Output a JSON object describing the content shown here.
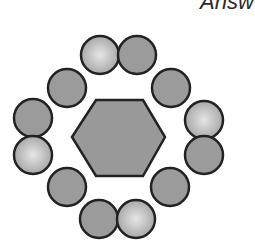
{
  "header": {
    "label": "Answ"
  },
  "colors": {
    "background": "#ffffff",
    "stroke": "#222222",
    "dark_fill": "#9b9b9b",
    "light_center": "#e6e6e6",
    "light_edge": "#a2a2a2",
    "hexagon_fill": "#999999"
  },
  "diagram": {
    "hexagon": {
      "points": "72,137 96,100 143,100 165,137 143,176 96,176"
    },
    "circle_radius": 19,
    "circles": [
      {
        "position": "top-left",
        "cx": 100,
        "cy": 55,
        "shade": "light"
      },
      {
        "position": "top-right",
        "cx": 137,
        "cy": 55,
        "shade": "dark"
      },
      {
        "position": "upper-left",
        "cx": 67,
        "cy": 88,
        "shade": "dark"
      },
      {
        "position": "upper-right",
        "cx": 171,
        "cy": 88,
        "shade": "dark"
      },
      {
        "position": "left-upper",
        "cx": 33,
        "cy": 118,
        "shade": "dark"
      },
      {
        "position": "left-lower",
        "cx": 33,
        "cy": 155,
        "shade": "light"
      },
      {
        "position": "right-upper",
        "cx": 204,
        "cy": 120,
        "shade": "light"
      },
      {
        "position": "right-lower",
        "cx": 204,
        "cy": 155,
        "shade": "dark"
      },
      {
        "position": "lower-left",
        "cx": 67,
        "cy": 187,
        "shade": "dark"
      },
      {
        "position": "lower-right",
        "cx": 170,
        "cy": 187,
        "shade": "dark"
      },
      {
        "position": "bottom-left",
        "cx": 99,
        "cy": 219,
        "shade": "dark"
      },
      {
        "position": "bottom-right",
        "cx": 136,
        "cy": 219,
        "shade": "light"
      }
    ]
  }
}
